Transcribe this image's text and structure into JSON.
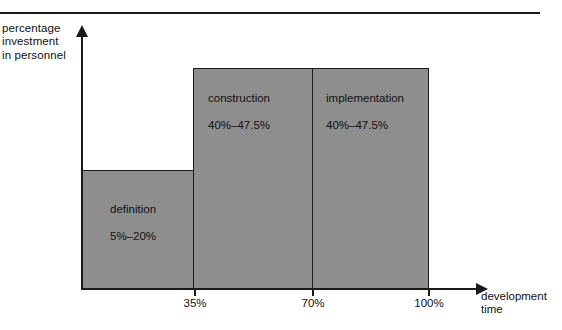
{
  "figure": {
    "title_rule": "horizontal-rule",
    "y_axis_label": "percentage\ninvestment\nin personnel",
    "x_axis_label": "development\ntime"
  },
  "chart_data": {
    "type": "bar",
    "title": "",
    "xlabel": "development time",
    "ylabel": "percentage investment in personnel",
    "xlim": [
      0,
      100
    ],
    "ylim": [
      0,
      47.5
    ],
    "grid": false,
    "legend": null,
    "categories": [
      "definition",
      "construction",
      "implementation"
    ],
    "values": [
      20,
      47.5,
      47.5
    ],
    "bars": [
      {
        "name": "definition",
        "label": "definition",
        "range_label": "5%–20%",
        "value_min": 5,
        "value_max": 20,
        "x_start": 0,
        "x_end": 35
      },
      {
        "name": "construction",
        "label": "construction",
        "range_label": "40%–47.5%",
        "value_min": 40,
        "value_max": 47.5,
        "x_start": 35,
        "x_end": 70
      },
      {
        "name": "implementation",
        "label": "implementation",
        "range_label": "40%–47.5%",
        "value_min": 40,
        "value_max": 47.5,
        "x_start": 70,
        "x_end": 100
      }
    ],
    "xticks": [
      "35%",
      "70%",
      "100%"
    ],
    "xtick_values": [
      35,
      70,
      100
    ],
    "yticks": [],
    "colors": {
      "bar_fill": "#8e8e8e",
      "bar_stroke": "#1c1c1c",
      "axis": "#1a1a1a",
      "text": "#111111",
      "background": "#ffffff"
    }
  }
}
